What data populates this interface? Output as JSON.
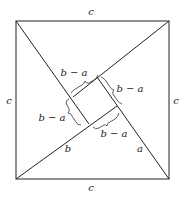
{
  "figure": {
    "outer_square": {
      "x1": 16,
      "y1": 21,
      "x2": 169,
      "y2": 179
    },
    "inner_square": {
      "top": [
        97,
        77
      ],
      "right": [
        117,
        106
      ],
      "bottom": [
        89,
        124
      ],
      "left": [
        73,
        97
      ]
    },
    "labels": {
      "top_side": "c",
      "bottom_side": "c",
      "left_side": "c",
      "right_side": "c",
      "inner_top_left": "b − a",
      "inner_top_right": "b − a",
      "inner_bottom_left": "b − a",
      "inner_bottom_right": "b − a",
      "leg_b": "b",
      "leg_a": "a"
    },
    "colors": {
      "line": "#222222",
      "background": "#ffffff"
    }
  }
}
